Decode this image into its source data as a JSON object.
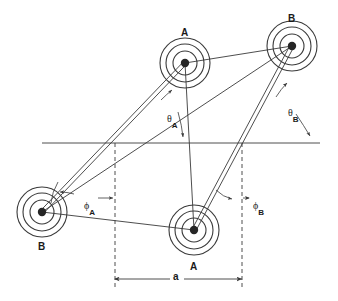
{
  "figure": {
    "type": "mechanism-kinematic-diagram",
    "background_color": "#ffffff",
    "line_color": "#3a3a3a",
    "hub_color": "#262626",
    "text_color": "#1a1a1a"
  },
  "nodes": [
    {
      "id": "A_top",
      "label": "A",
      "cx": 185,
      "cy": 63,
      "label_x": 181,
      "label_y": 28,
      "radii": [
        25,
        19,
        12
      ]
    },
    {
      "id": "B_top",
      "label": "B",
      "cx": 292,
      "cy": 46,
      "label_x": 288,
      "label_y": 14,
      "radii": [
        25,
        19,
        12
      ]
    },
    {
      "id": "B_bottom",
      "label": "B",
      "cx": 42,
      "cy": 212,
      "label_x": 38,
      "label_y": 242,
      "radii": [
        25,
        19,
        12
      ]
    },
    {
      "id": "A_bottom",
      "label": "A",
      "cx": 194,
      "cy": 230,
      "label_x": 190,
      "label_y": 262,
      "radii": [
        25,
        19,
        12
      ]
    }
  ],
  "reference_line": {
    "name": "horizontal-datum",
    "x1": 42,
    "y1": 143,
    "x2": 320,
    "y2": 143
  },
  "dashed_verticals": [
    {
      "name": "left-extension-line",
      "x": 115,
      "y1": 143,
      "y2": 288
    },
    {
      "name": "right-extension-line",
      "x": 242,
      "y1": 143,
      "y2": 288
    }
  ],
  "dimension": {
    "label": "a",
    "label_x": 176,
    "label_y": 272,
    "x1": 115,
    "x2": 242,
    "y": 279
  },
  "angles": [
    {
      "id": "theta_A",
      "symbol": "θ",
      "subscript": "A",
      "label_x": 167,
      "label_y": 109
    },
    {
      "id": "theta_B",
      "symbol": "θ",
      "subscript": "B",
      "label_x": 288,
      "label_y": 103
    },
    {
      "id": "phi_A",
      "symbol": "ϕ",
      "subscript": "A",
      "label_x": 84,
      "label_y": 196
    },
    {
      "id": "phi_B",
      "symbol": "ϕ",
      "subscript": "B",
      "label_x": 253,
      "label_y": 196
    }
  ],
  "links": [
    {
      "name": "link-B-bottom-to-A-top",
      "style": "double",
      "from": "B_bottom",
      "to": "A_top"
    },
    {
      "name": "link-A-bottom-to-B-top",
      "style": "double",
      "from": "A_bottom",
      "to": "B_top"
    },
    {
      "name": "link-A-top-to-B-top",
      "style": "single",
      "from": "A_top",
      "to": "B_top"
    },
    {
      "name": "link-B-bottom-to-A-bottom",
      "style": "single",
      "from": "B_bottom",
      "to": "A_bottom"
    },
    {
      "name": "link-B-bottom-to-B-top",
      "style": "single",
      "from": "B_bottom",
      "to": "B_top"
    },
    {
      "name": "link-A-top-to-A-bottom",
      "style": "single",
      "from": "A_top",
      "to": "A_bottom"
    }
  ]
}
